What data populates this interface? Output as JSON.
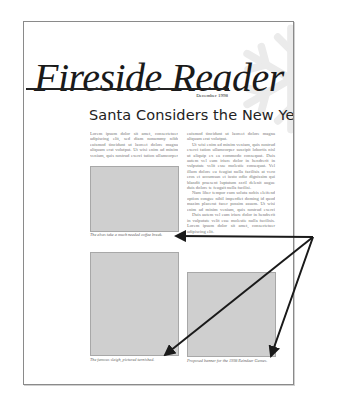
{
  "newsletter": {
    "masthead": "Fireside Reader",
    "date": "December 1998",
    "headline": "Santa Considers the New Year",
    "left_column": [
      "Lorem ipsum dolor sit amet, consectetuer adipiscing elit, sed diam nonummy nibh euismod tincidunt ut laoreet dolore magna aliquam erat volutpat. Ut wisi enim ad minim veniam, quis nostrud exerci tation ullamcorper suscipit lobortis nisl ut aliquip ex ea commodo consequat."
    ],
    "right_column": [
      "euismod tincidunt ut laoreet dolore magna aliquam erat volutpat.",
      "Ut wisi enim ad minim veniam, quis nostrud exerci tation ullamcorper suscipit lobortis nisl ut aliquip ex ea commodo consequat. Duis autem vel eum iriure dolor in hendrerit in vulputate velit esse molestie consequat. Vel illum dolore eu feugiat nulla facilisis at vero eros et accumsan et iusto odio dignissim qui blandit praesent luptatum zzril delenit augue duis dolore te feugait nulla facilisi.",
      "Nam liber tempor cum soluta nobis eleifend option congue nihil imperdiet doming id quod mazim placerat facer possim assum. Ut wisi enim ad minim veniam, quis nostrud exerci tation ullamcorper suscipit lobortis nisl ut aliquip ex ea commodo.",
      "Duis autem vel eum iriure dolor in hendrerit in vulputate velit esse molestie nulla facilisis. Lorem ipsum dolor sit amet, consectetuer adipiscing elit."
    ],
    "captions": [
      "The elves take a much needed coffee break.",
      "The famous sleigh, pictured tarnished.",
      "Proposed banner for the 1998 Reindeer Games."
    ]
  },
  "colors": {
    "placeholder_fill": "#cfcfcf",
    "arrow": "#1a1a1a",
    "snowflake": "#ececec"
  }
}
